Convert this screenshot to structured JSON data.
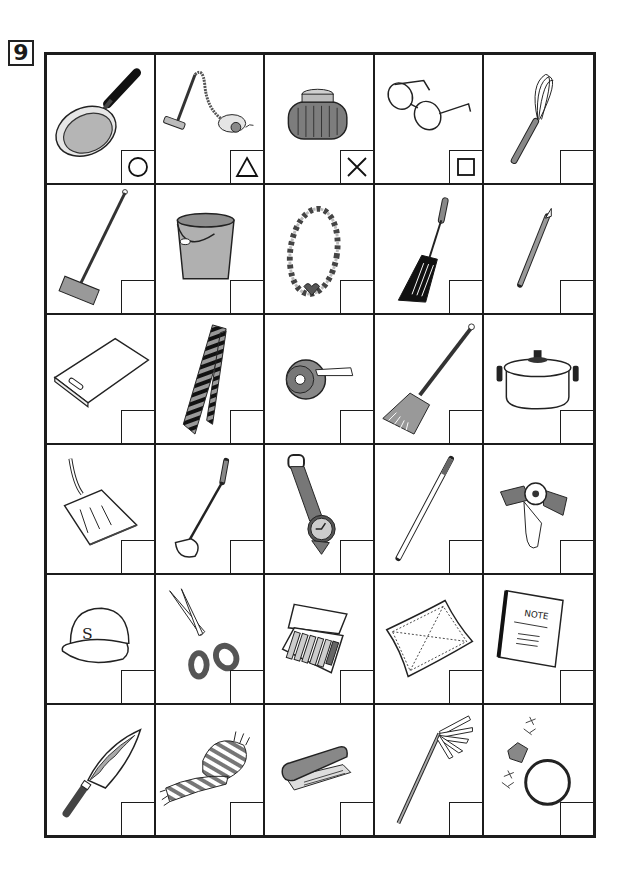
{
  "worksheet": {
    "problem_number": "9",
    "grid": {
      "rows": 6,
      "columns": 5
    },
    "colors": {
      "line": "#1c1c1c",
      "fill_gray": "#8a8a8a",
      "light_gray": "#bdbdbd",
      "dark": "#222222"
    },
    "items": [
      {
        "name": "frying pan",
        "mark": "circle"
      },
      {
        "name": "vacuum cleaner",
        "mark": "triangle"
      },
      {
        "name": "rice cooker pot",
        "mark": "cross"
      },
      {
        "name": "eyeglasses",
        "mark": "square"
      },
      {
        "name": "whisk",
        "mark": ""
      },
      {
        "name": "broom (deck brush)",
        "mark": ""
      },
      {
        "name": "bucket",
        "mark": ""
      },
      {
        "name": "bead necklace",
        "mark": ""
      },
      {
        "name": "spatula",
        "mark": ""
      },
      {
        "name": "pencil",
        "mark": ""
      },
      {
        "name": "cutting board",
        "mark": ""
      },
      {
        "name": "necktie",
        "mark": ""
      },
      {
        "name": "tape dispenser",
        "mark": ""
      },
      {
        "name": "hand broom",
        "mark": ""
      },
      {
        "name": "cooking pot",
        "mark": ""
      },
      {
        "name": "dustpan",
        "mark": ""
      },
      {
        "name": "ladle",
        "mark": ""
      },
      {
        "name": "wristwatch",
        "mark": ""
      },
      {
        "name": "pen",
        "mark": ""
      },
      {
        "name": "hair clip",
        "mark": ""
      },
      {
        "name": "baseball cap",
        "mark": ""
      },
      {
        "name": "scissors",
        "mark": ""
      },
      {
        "name": "crayons box",
        "mark": ""
      },
      {
        "name": "handkerchief",
        "mark": ""
      },
      {
        "name": "notebook",
        "mark": ""
      },
      {
        "name": "kitchen knife",
        "mark": ""
      },
      {
        "name": "scarf",
        "mark": ""
      },
      {
        "name": "stapler",
        "mark": ""
      },
      {
        "name": "mop",
        "mark": ""
      },
      {
        "name": "diamond ring",
        "mark": ""
      }
    ],
    "cap_letter": "S",
    "notebook_text": "NOTE"
  }
}
